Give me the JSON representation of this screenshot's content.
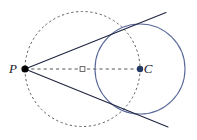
{
  "figure": {
    "width": 197,
    "height": 140,
    "background_color": "#ffffff"
  },
  "labels": {
    "point_p": "P",
    "point_c": "C"
  },
  "colors": {
    "main_circle_stroke": "#5a6a9a",
    "dashed_circle_stroke": "#555555",
    "tangent_line_stroke": "#1f2440",
    "dashed_segment_stroke": "#555555",
    "point_p_fill": "#000000",
    "point_c_fill": "#243a66",
    "midpoint_fill": "#ffffff",
    "midpoint_stroke": "#555555",
    "label_fill": "#1a1a2e"
  },
  "chart_data": {
    "type": "scatter",
    "xlabel": "",
    "ylabel": "",
    "xlim": [
      0,
      197
    ],
    "ylim": [
      140,
      0
    ],
    "grid": false,
    "legend": "none",
    "points": [
      {
        "name": "P",
        "label": "P",
        "x": 25,
        "y": 69,
        "style": "filled-dot",
        "radius": 3.6,
        "label_dx": -12,
        "label_dy": 4
      },
      {
        "name": "C",
        "label": "C",
        "x": 140,
        "y": 69,
        "style": "filled-dot",
        "radius": 3.2,
        "label_dx": 8,
        "label_dy": 4
      },
      {
        "name": "midpoint-PC",
        "label": "",
        "x": 82.5,
        "y": 69,
        "style": "hollow-square",
        "radius": 2.4,
        "label_dx": 0,
        "label_dy": 0
      },
      {
        "name": "tangent-point-upper",
        "label": "",
        "x": 120.0,
        "y": 29.2,
        "style": "none",
        "radius": 0,
        "label_dx": 0,
        "label_dy": 0
      },
      {
        "name": "tangent-point-lower",
        "label": "",
        "x": 120.0,
        "y": 108.8,
        "style": "none",
        "radius": 0,
        "label_dx": 0,
        "label_dy": 0
      }
    ],
    "circles": [
      {
        "name": "main-circle",
        "cx": 140,
        "cy": 69,
        "r": 45,
        "stroke": "#5a6a9a",
        "dashed": false,
        "stroke_width": 1.1
      },
      {
        "name": "thales-circle",
        "cx": 82.5,
        "cy": 69,
        "r": 57.5,
        "stroke": "#555555",
        "dashed": true,
        "stroke_width": 1.0,
        "dash_pattern": "2.2 2.6"
      }
    ],
    "segments": [
      {
        "name": "diameter-PC",
        "x1": 25,
        "y1": 69,
        "x2": 140,
        "y2": 69,
        "stroke": "#555555",
        "dashed": true,
        "stroke_width": 1.0,
        "dash_pattern": "3.2 3.0"
      },
      {
        "name": "tangent-line-upper",
        "x1": 25,
        "y1": 69,
        "x2": 166,
        "y2": 12.5,
        "stroke": "#1f2440",
        "dashed": false,
        "stroke_width": 1.1
      },
      {
        "name": "tangent-line-lower",
        "x1": 25,
        "y1": 69,
        "x2": 168,
        "y2": 127,
        "stroke": "#1f2440",
        "dashed": false,
        "stroke_width": 1.1
      }
    ]
  }
}
